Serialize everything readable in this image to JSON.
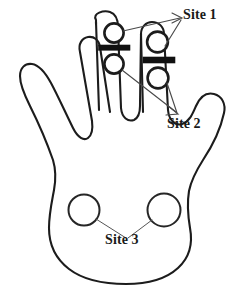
{
  "figure": {
    "background_color": "#ffffff",
    "outline_color": "#1c1c1c",
    "band_color": "#111111",
    "leader_color": "#4a4a4a",
    "label_color": "#1a1a1a"
  },
  "labels": {
    "site_1": "Site 1",
    "site_2": "Site 2",
    "site_3": "Site 3"
  },
  "annotations": [
    {
      "id": "site-1",
      "label": "Site 1",
      "description": "distal phalanx sensor rings on middle and ring fingertips",
      "marker_count": 2,
      "label_position": {
        "x": 183,
        "y": 8
      },
      "markers": [
        {
          "cx": 114,
          "cy": 33,
          "r": 10
        },
        {
          "cx": 157,
          "cy": 42,
          "r": 11
        }
      ]
    },
    {
      "id": "site-2",
      "label": "Site 2",
      "description": "middle phalanx sensor rings below the black bands",
      "marker_count": 2,
      "label_position": {
        "x": 167,
        "y": 117
      },
      "markers": [
        {
          "cx": 114,
          "cy": 64,
          "r": 10
        },
        {
          "cx": 158,
          "cy": 78,
          "r": 11
        }
      ]
    },
    {
      "id": "site-3",
      "label": "Site 3",
      "description": "two palm sensor circles on the thenar and hypothenar regions",
      "marker_count": 2,
      "label_position": {
        "x": 105,
        "y": 233
      },
      "markers": [
        {
          "cx": 84,
          "cy": 210,
          "r": 16
        },
        {
          "cx": 164,
          "cy": 210,
          "r": 17
        }
      ]
    }
  ],
  "bands": [
    {
      "id": "band-middle-finger",
      "x": 99,
      "y": 45,
      "width": 31,
      "height": 5
    },
    {
      "id": "band-ring-finger",
      "x": 143,
      "y": 57,
      "width": 32,
      "height": 6
    }
  ]
}
